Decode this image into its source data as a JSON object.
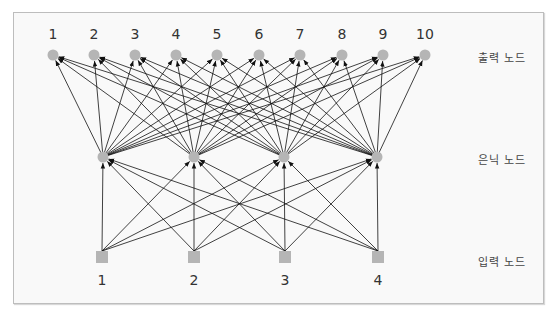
{
  "diagram": {
    "type": "neural-network",
    "layers": {
      "output": {
        "label": "출력 노드",
        "node_shape": "circle",
        "nodes": [
          {
            "id": "1",
            "x": 53
          },
          {
            "id": "2",
            "x": 94
          },
          {
            "id": "3",
            "x": 135
          },
          {
            "id": "4",
            "x": 176
          },
          {
            "id": "5",
            "x": 217
          },
          {
            "id": "6",
            "x": 259
          },
          {
            "id": "7",
            "x": 300
          },
          {
            "id": "8",
            "x": 342
          },
          {
            "id": "9",
            "x": 383
          },
          {
            "id": "10",
            "x": 425
          }
        ],
        "y": 55
      },
      "hidden": {
        "label": "은닉 노드",
        "node_shape": "circle",
        "nodes": [
          {
            "x": 103
          },
          {
            "x": 194
          },
          {
            "x": 284
          },
          {
            "x": 377
          }
        ],
        "y": 157
      },
      "input": {
        "label": "입력 노드",
        "node_shape": "square",
        "nodes": [
          {
            "id": "1",
            "x": 102
          },
          {
            "id": "2",
            "x": 194
          },
          {
            "id": "3",
            "x": 285
          },
          {
            "id": "4",
            "x": 378
          }
        ],
        "y": 257
      }
    },
    "connections": "fully-connected input→hidden and hidden→output, arrows pointing upward",
    "colors": {
      "node": "#b5b5b5",
      "edge": "#111111",
      "frame_bg": "#f9f9f9",
      "frame_border": "#bdbdbd"
    }
  }
}
